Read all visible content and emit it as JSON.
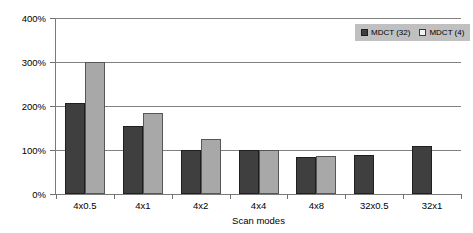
{
  "chart_data": {
    "type": "bar",
    "title": "",
    "xlabel": "Scan modes",
    "ylabel": "",
    "ylim": [
      0,
      400
    ],
    "ytick_labels": [
      "0%",
      "100%",
      "200%",
      "300%",
      "400%"
    ],
    "ytick_values": [
      0,
      100,
      200,
      300,
      400
    ],
    "grid": true,
    "legend_position": "top-right",
    "categories": [
      "4x0.5",
      "4x1",
      "4x2",
      "4x4",
      "4x8",
      "32x0.5",
      "32x1"
    ],
    "series": [
      {
        "name": "MDCT (32)",
        "color": "#3f3f3f",
        "values": [
          207,
          155,
          100,
          100,
          83,
          88,
          110
        ]
      },
      {
        "name": "MDCT (4)",
        "color": "#a8a8a8",
        "values": [
          300,
          185,
          124,
          100,
          86,
          null,
          null
        ]
      }
    ]
  },
  "legend": {
    "entries": [
      {
        "label": "MDCT (32)"
      },
      {
        "label": "MDCT (4)"
      }
    ]
  },
  "colors": {
    "series_32": "#3f3f3f",
    "series_4": "#a8a8a8",
    "gridline": "#808080",
    "axis": "#7a7a7a",
    "legend_background": "#c0c0c0",
    "text": "#000000",
    "plot_background": "#ffffff"
  }
}
